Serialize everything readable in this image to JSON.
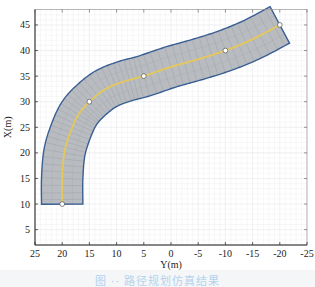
{
  "chart_data": {
    "type": "line",
    "title": "",
    "xlabel": "Y(m)",
    "ylabel": "X(m)",
    "xlim": [
      25,
      -25
    ],
    "ylim": [
      2,
      48
    ],
    "x_reversed": true,
    "grid": true,
    "legend": null,
    "x_ticks": [
      25,
      20,
      15,
      10,
      5,
      0,
      -5,
      -10,
      -15,
      -20,
      -25
    ],
    "y_ticks": [
      5,
      10,
      15,
      20,
      25,
      30,
      35,
      40,
      45
    ],
    "series": [
      {
        "name": "centerline",
        "style": "yellow line",
        "color": "#e6c75a",
        "points": [
          [
            20,
            10
          ],
          [
            20,
            15
          ],
          [
            19.6,
            20
          ],
          [
            18.5,
            24
          ],
          [
            17,
            27.5
          ],
          [
            15,
            30
          ],
          [
            12,
            32.5
          ],
          [
            8.5,
            34
          ],
          [
            5,
            35
          ],
          [
            0,
            36.8
          ],
          [
            -5,
            38.3
          ],
          [
            -10,
            40
          ],
          [
            -15,
            42.2
          ],
          [
            -20,
            45
          ]
        ]
      },
      {
        "name": "waypoints",
        "style": "white circle markers",
        "points": [
          [
            20,
            10
          ],
          [
            15,
            30
          ],
          [
            5,
            35
          ],
          [
            -10,
            40
          ],
          [
            -20,
            45
          ]
        ]
      },
      {
        "name": "road-boundary",
        "style": "grey filled band with dark blue outline",
        "fill": "#b8bcc0",
        "stroke": "#3a5f94",
        "half_width_m": 3.8
      }
    ]
  },
  "axes": {
    "x_label": "Y(m)",
    "y_label": "X(m)",
    "x_tick_labels": [
      "25",
      "20",
      "15",
      "10",
      "5",
      "0",
      "-5",
      "-10",
      "-15",
      "-20",
      "-25"
    ],
    "y_tick_labels": [
      "5",
      "10",
      "15",
      "20",
      "25",
      "30",
      "35",
      "40",
      "45"
    ]
  },
  "caption": "图 ·· 路径规划仿真结果"
}
